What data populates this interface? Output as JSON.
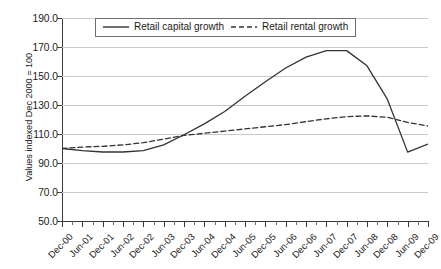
{
  "chart_data": {
    "type": "line",
    "title": "",
    "xlabel": "",
    "ylabel": "Values indexed Dec 2000 = 100",
    "ylim": [
      50.0,
      190.0
    ],
    "ytick_labels": [
      "190.0",
      "170.0",
      "150.0",
      "130.0",
      "110.0",
      "90.0",
      "70.0",
      "50.0"
    ],
    "ytick_values": [
      190.0,
      170.0,
      150.0,
      130.0,
      110.0,
      90.0,
      70.0,
      50.0
    ],
    "grid": true,
    "legend_position": "top-center",
    "categories": [
      "Dec-00",
      "Jun-01",
      "Dec-01",
      "Jun-02",
      "Dec-02",
      "Jun-03",
      "Dec-03",
      "Jun-04",
      "Dec-04",
      "Jun-05",
      "Dec-05",
      "Jun-06",
      "Dec-06",
      "Jun-07",
      "Dec-07",
      "Jun-08",
      "Dec-08",
      "Jun-09",
      "Dec-09"
    ],
    "series": [
      {
        "name": "Retail capital growth",
        "style": "solid",
        "color": "#333333",
        "values": [
          100.0,
          98.5,
          97.6,
          97.6,
          98.6,
          102.5,
          109.5,
          117.0,
          125.5,
          136.0,
          146.0,
          155.5,
          163.0,
          167.5,
          167.5,
          157.0,
          134.0,
          97.5,
          103.0
        ]
      },
      {
        "name": "Retail rental growth",
        "style": "dashed",
        "color": "#333333",
        "values": [
          100.0,
          101.0,
          101.5,
          102.5,
          104.0,
          106.5,
          109.0,
          110.5,
          112.0,
          113.5,
          115.0,
          116.5,
          118.5,
          120.5,
          122.0,
          122.5,
          121.5,
          118.0,
          115.5
        ]
      }
    ]
  },
  "legend": {
    "items": [
      {
        "label": "Retail capital growth",
        "style": "solid"
      },
      {
        "label": "Retail rental growth",
        "style": "dashed"
      }
    ]
  }
}
